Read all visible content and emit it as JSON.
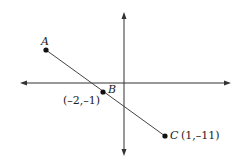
{
  "diagram": {
    "type": "coordinate-plane-line",
    "points": [
      {
        "name": "A",
        "label": "A",
        "coords": ""
      },
      {
        "name": "B",
        "label": "B",
        "coords": "(–2,–1)"
      },
      {
        "name": "C",
        "label": "C",
        "coords": "(1,–11)"
      }
    ],
    "colors": {
      "axis": "#333333",
      "line": "#444444",
      "point": "#111111",
      "background": "#ffffff"
    }
  }
}
